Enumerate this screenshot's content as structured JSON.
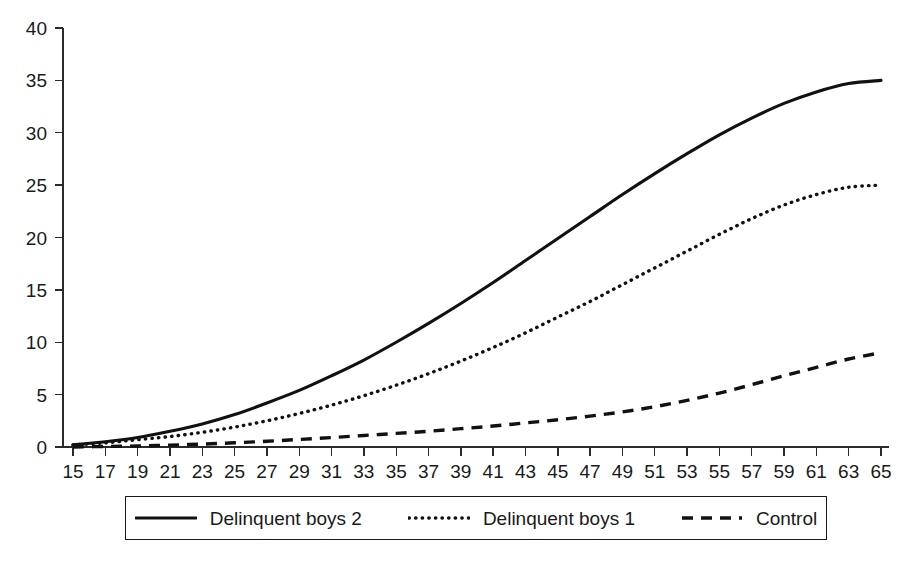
{
  "chart_data": {
    "type": "line",
    "title": "",
    "subtitle": "",
    "xlabel": "",
    "ylabel": "",
    "xlim": [
      15,
      65
    ],
    "ylim": [
      0,
      40
    ],
    "grid": false,
    "legend_position": "bottom",
    "x_ticks": [
      15,
      17,
      19,
      21,
      23,
      25,
      27,
      29,
      31,
      33,
      35,
      37,
      39,
      41,
      43,
      45,
      47,
      49,
      51,
      53,
      55,
      57,
      59,
      61,
      63,
      65
    ],
    "y_ticks": [
      0,
      5,
      10,
      15,
      20,
      25,
      30,
      35,
      40
    ],
    "x": [
      15,
      17,
      19,
      21,
      23,
      25,
      27,
      29,
      31,
      33,
      35,
      37,
      39,
      41,
      43,
      45,
      47,
      49,
      51,
      53,
      55,
      57,
      59,
      61,
      63,
      65
    ],
    "series": [
      {
        "name": "Delinquent boys 2",
        "style": "solid",
        "color": "#111111",
        "values": [
          0.2,
          0.5,
          0.9,
          1.5,
          2.2,
          3.1,
          4.2,
          5.4,
          6.8,
          8.3,
          10.0,
          11.8,
          13.7,
          15.7,
          17.8,
          19.9,
          22.0,
          24.1,
          26.1,
          28.0,
          29.8,
          31.4,
          32.8,
          33.9,
          34.7,
          35.0
        ]
      },
      {
        "name": "Delinquent boys 1",
        "style": "dotted",
        "color": "#111111",
        "values": [
          0.2,
          0.4,
          0.7,
          1.0,
          1.4,
          1.9,
          2.5,
          3.2,
          4.0,
          4.9,
          5.9,
          7.0,
          8.2,
          9.5,
          10.9,
          12.4,
          13.9,
          15.5,
          17.1,
          18.7,
          20.3,
          21.8,
          23.1,
          24.1,
          24.8,
          25.0
        ]
      },
      {
        "name": "Control",
        "style": "dashed",
        "color": "#111111",
        "values": [
          0.0,
          0.05,
          0.1,
          0.18,
          0.28,
          0.4,
          0.55,
          0.72,
          0.9,
          1.1,
          1.3,
          1.5,
          1.75,
          2.0,
          2.3,
          2.6,
          2.95,
          3.35,
          3.85,
          4.45,
          5.15,
          5.95,
          6.8,
          7.6,
          8.4,
          9.0
        ]
      }
    ],
    "legend": [
      {
        "label": "Delinquent boys 2",
        "style": "solid"
      },
      {
        "label": "Delinquent boys 1",
        "style": "dotted"
      },
      {
        "label": "Control",
        "style": "dashed"
      }
    ]
  }
}
